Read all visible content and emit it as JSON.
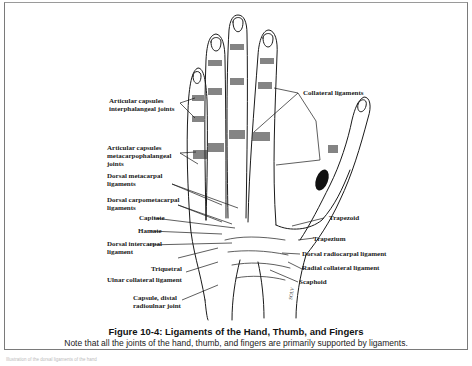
{
  "figure": {
    "title": "Figure 10-4: Ligaments of the Hand, Thumb, and Fingers",
    "caption": "Note that all the joints of the hand, thumb, and fingers are primarily supported by ligaments.",
    "artist_signature": "SOLV"
  },
  "labels": {
    "articular_capsules_ip_line1": "Articular capsules",
    "articular_capsules_ip_line2": "interphalangeal joints",
    "articular_capsules_mcp_line1": "Articular capsules",
    "articular_capsules_mcp_line2": "metacarpophalangeal",
    "articular_capsules_mcp_line3": "joints",
    "dorsal_metacarpal_line1": "Dorsal metacarpal",
    "dorsal_metacarpal_line2": "ligaments",
    "dorsal_carpometacarpal_line1": "Dorsal carpometacarpal",
    "dorsal_carpometacarpal_line2": "ligaments",
    "capitate": "Capitate",
    "hamate": "Hamate",
    "dorsal_intercarpal_line1": "Dorsal intercarpal",
    "dorsal_intercarpal_line2": "ligament",
    "triquetral": "Triquetral",
    "ulnar_collateral": "Ulnar collateral ligament",
    "capsule_distal_line1": "Capsule, distal",
    "capsule_distal_line2": "radioulnar joint",
    "collateral_ligaments": "Collateral ligaments",
    "trapezoid": "Trapezoid",
    "trapezium": "Trapezium",
    "dorsal_radiocarpal": "Dorsal radiocarpal ligament",
    "radial_collateral": "Radial collateral ligament",
    "scaphoid": "Scaphoid"
  },
  "footer": {
    "text": "Illustration of the dorsal ligaments of the hand"
  }
}
